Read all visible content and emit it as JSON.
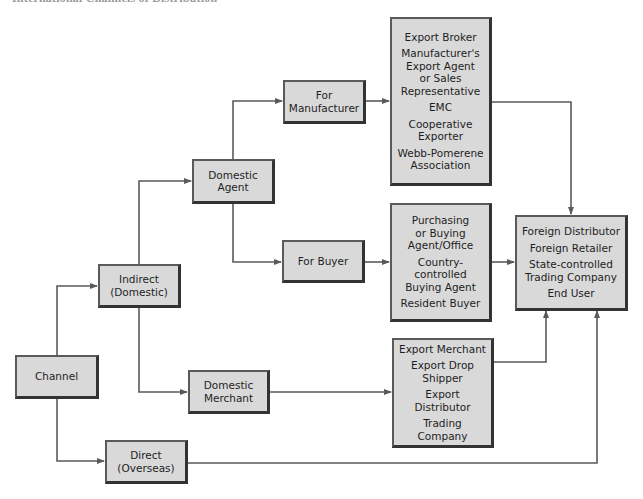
{
  "title": "International Channels of Distribution",
  "colors": {
    "box_fill": "#d9d9d9",
    "box_border": "#333333",
    "connector": "#5a5a5a",
    "text": "#1e1e1e"
  },
  "nodes": {
    "channel": {
      "lines": [
        "Channel"
      ]
    },
    "indirect": {
      "lines": [
        "Indirect",
        "(Domestic)"
      ]
    },
    "direct": {
      "lines": [
        "Direct",
        "(Overseas)"
      ]
    },
    "domestic_agent": {
      "lines": [
        "Domestic",
        "Agent"
      ]
    },
    "domestic_merchant": {
      "lines": [
        "Domestic",
        "Merchant"
      ]
    },
    "for_manufacturer": {
      "lines": [
        "For",
        "Manufacturer"
      ]
    },
    "for_buyer": {
      "lines": [
        "For Buyer"
      ]
    },
    "manufacturer_intermediaries": {
      "items": [
        [
          "Export Broker"
        ],
        [
          "Manufacturer's",
          "Export Agent",
          "or Sales",
          "Representative"
        ],
        [
          "EMC"
        ],
        [
          "Cooperative",
          "Exporter"
        ],
        [
          "Webb-Pomerene",
          "Association"
        ]
      ]
    },
    "buyer_intermediaries": {
      "items": [
        [
          "Purchasing",
          "or Buying",
          "Agent/Office"
        ],
        [
          "Country-",
          "controlled",
          "Buying Agent"
        ],
        [
          "Resident Buyer"
        ]
      ]
    },
    "merchant_intermediaries": {
      "items": [
        [
          "Export Merchant"
        ],
        [
          "Export Drop",
          "Shipper"
        ],
        [
          "Export",
          "Distributor"
        ],
        [
          "Trading Company"
        ]
      ]
    },
    "foreign_destinations": {
      "items": [
        [
          "Foreign Distributor"
        ],
        [
          "Foreign Retailer"
        ],
        [
          "State-controlled",
          "Trading Company"
        ],
        [
          "End User"
        ]
      ]
    }
  },
  "edges": [
    {
      "from": "channel",
      "to": "indirect"
    },
    {
      "from": "channel",
      "to": "direct"
    },
    {
      "from": "indirect",
      "to": "domestic_agent"
    },
    {
      "from": "indirect",
      "to": "domestic_merchant"
    },
    {
      "from": "domestic_agent",
      "to": "for_manufacturer"
    },
    {
      "from": "domestic_agent",
      "to": "for_buyer"
    },
    {
      "from": "for_manufacturer",
      "to": "manufacturer_intermediaries"
    },
    {
      "from": "for_buyer",
      "to": "buyer_intermediaries"
    },
    {
      "from": "domestic_merchant",
      "to": "merchant_intermediaries"
    },
    {
      "from": "manufacturer_intermediaries",
      "to": "foreign_destinations"
    },
    {
      "from": "buyer_intermediaries",
      "to": "foreign_destinations"
    },
    {
      "from": "merchant_intermediaries",
      "to": "foreign_destinations"
    },
    {
      "from": "direct",
      "to": "foreign_destinations"
    }
  ]
}
